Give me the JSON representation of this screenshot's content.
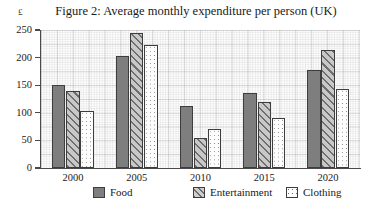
{
  "chart_data": {
    "type": "bar",
    "title": "Figure 2: Average monthly expenditure per person (UK)",
    "xlabel": "",
    "ylabel": "£",
    "categories": [
      "2000",
      "2005",
      "2010",
      "2015",
      "2020"
    ],
    "series": [
      {
        "name": "Food",
        "values": [
          150,
          203,
          113,
          135,
          177
        ],
        "color": "#7e7e7e",
        "pattern": "solid-gray"
      },
      {
        "name": "Entertainment",
        "values": [
          140,
          245,
          55,
          119,
          214
        ],
        "color": "#c8c8c8",
        "pattern": "diagonal-hatch"
      },
      {
        "name": "Clothing",
        "values": [
          103,
          223,
          70,
          90,
          143
        ],
        "color": "#fcfcfc",
        "pattern": "dotted"
      }
    ],
    "ylim": [
      0,
      250
    ],
    "yticks": [
      0,
      50,
      100,
      150,
      200,
      250
    ],
    "ytick_labels": [
      "0",
      "50",
      "100",
      "150",
      "200",
      "250"
    ],
    "grid": true,
    "legend_position": "bottom"
  },
  "axes": {
    "unit_label": "£",
    "y_tick_labels": [
      "250",
      "200",
      "150",
      "100",
      "50",
      "0"
    ],
    "x_tick_labels": [
      "2000",
      "2005",
      "2010",
      "2015",
      "2020"
    ]
  },
  "legend": {
    "entries": [
      {
        "label": "Food"
      },
      {
        "label": "Entertainment"
      },
      {
        "label": "Clothing"
      }
    ]
  }
}
